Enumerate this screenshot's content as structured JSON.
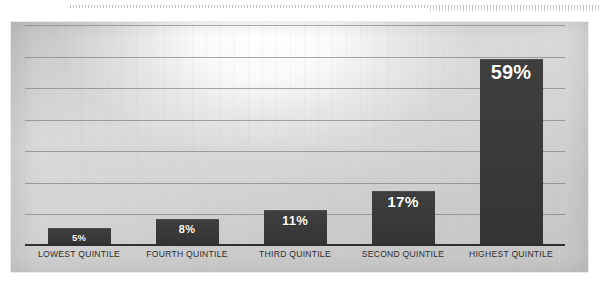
{
  "chart_data": {
    "type": "bar",
    "title": "",
    "subtitle": "",
    "xlabel": "",
    "ylabel": "",
    "categories": [
      "LOWEST QUINTILE",
      "FOURTH QUINTILE",
      "THIRD QUINTILE",
      "SECOND QUINTILE",
      "HIGHEST QUINTILE"
    ],
    "values": [
      5,
      8,
      11,
      17,
      59
    ],
    "data_labels": [
      "5%",
      "8%",
      "11%",
      "17%",
      "59%"
    ],
    "ylim": [
      0,
      70
    ],
    "grid": true,
    "gridlines": [
      0,
      10,
      20,
      30,
      40,
      50,
      60,
      70
    ],
    "legend": "none",
    "bar_color": "#3a3a3a",
    "label_color": "#ffffff",
    "plot_background": "#d4d4d4",
    "axis_color": "#2f2f2f",
    "gridline_color": "#767676"
  },
  "panel": {
    "name": "bar-chart-panel"
  }
}
